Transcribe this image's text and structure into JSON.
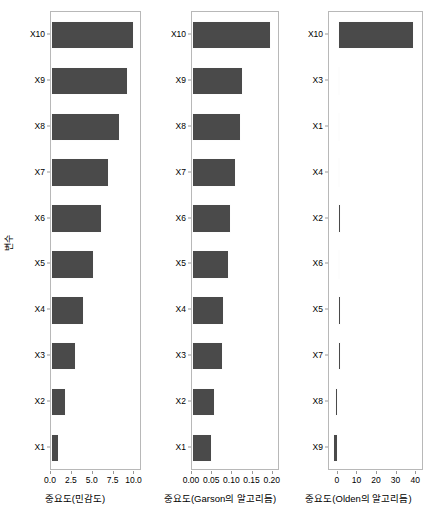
{
  "figure": {
    "background": "#ffffff",
    "bar_color": "#4a4a4a",
    "axis_color": "#b8b8b8",
    "y_axis_title": "변수"
  },
  "chart_data": [
    {
      "type": "bar",
      "orientation": "horizontal",
      "panel": 1,
      "title": "",
      "xlabel": "중요도(민감도)",
      "ylabel": "변수",
      "xlim": [
        0,
        10.9
      ],
      "xticks": [
        0.0,
        2.5,
        5.0,
        7.5,
        10.0
      ],
      "xtick_labels": [
        "0.0",
        "2.5",
        "5.0",
        "7.5",
        "10.0"
      ],
      "grid": false,
      "categories": [
        "X10",
        "X9",
        "X8",
        "X7",
        "X6",
        "X5",
        "X4",
        "X3",
        "X2",
        "X1"
      ],
      "values": [
        10.0,
        9.2,
        8.3,
        7.0,
        6.1,
        5.1,
        4.0,
        3.0,
        1.8,
        0.9
      ]
    },
    {
      "type": "bar",
      "orientation": "horizontal",
      "panel": 2,
      "title": "",
      "xlabel": "중요도(Garson의 알고리듬)",
      "ylabel": "",
      "xlim": [
        0.0,
        0.218
      ],
      "xticks": [
        0.0,
        0.05,
        0.1,
        0.15,
        0.2
      ],
      "xtick_labels": [
        "0.00",
        "0.05",
        "0.10",
        "0.15",
        "0.20"
      ],
      "grid": false,
      "categories": [
        "X10",
        "X9",
        "X8",
        "X7",
        "X6",
        "X5",
        "X4",
        "X3",
        "X2",
        "X1"
      ],
      "values": [
        0.195,
        0.126,
        0.121,
        0.11,
        0.096,
        0.092,
        0.08,
        0.076,
        0.056,
        0.05
      ]
    },
    {
      "type": "bar",
      "orientation": "horizontal",
      "panel": 3,
      "title": "",
      "xlabel": "중요도(Olden의 알고리듬)",
      "ylabel": "",
      "xlim": [
        -4.5,
        44
      ],
      "xticks": [
        0,
        10,
        20,
        30,
        40
      ],
      "xtick_labels": [
        "0",
        "10",
        "20",
        "30",
        "40"
      ],
      "grid": false,
      "categories": [
        "X10",
        "X3",
        "X1",
        "X4",
        "X2",
        "X6",
        "X5",
        "X7",
        "X8",
        "X9"
      ],
      "values": [
        39.0,
        0.4,
        0.5,
        1.3,
        1.6,
        1.3,
        1.4,
        1.7,
        -1.2,
        -2.4
      ]
    }
  ]
}
